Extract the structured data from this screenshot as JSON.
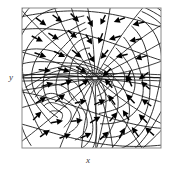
{
  "figure": {
    "type": "vector-field-contour-plot",
    "title": "",
    "xlabel": "x",
    "ylabel": "y",
    "frame": {
      "left": 22,
      "top": 8,
      "right": 161,
      "bottom": 148
    },
    "colors": {
      "background": "#ffffff",
      "frame": "#8a8a8a",
      "contour": "#1a1a1a",
      "arrow": "#000000",
      "label": "#3a3a3a"
    }
  },
  "chart_data": {
    "type": "scatter",
    "title": "",
    "xlabel": "x",
    "ylabel": "y",
    "xlim": [
      0,
      1
    ],
    "ylim": [
      0,
      1
    ],
    "grid": false,
    "legend": null,
    "singular_points": [
      {
        "name": "central-focus",
        "x": 0.525,
        "y": 0.5
      },
      {
        "name": "lower-left-node",
        "x": 0.24,
        "y": 0.22
      }
    ],
    "contour_families": [
      {
        "name": "upper-left-fan",
        "center_x": 0.52,
        "center_y": 0.5,
        "count": 14
      },
      {
        "name": "lower-right-fan",
        "center_x": 0.52,
        "center_y": 0.5,
        "count": 14
      },
      {
        "name": "lower-left-fan",
        "center_x": 0.24,
        "center_y": 0.22,
        "count": 9
      },
      {
        "name": "radial-spokes",
        "center_x": 0.525,
        "center_y": 0.5,
        "count": 22
      }
    ],
    "arrows": [
      {
        "x": 0.1,
        "y": 0.93,
        "dx": 0.075,
        "dy": -0.055
      },
      {
        "x": 0.22,
        "y": 0.95,
        "dx": 0.07,
        "dy": -0.05
      },
      {
        "x": 0.35,
        "y": 0.96,
        "dx": 0.06,
        "dy": -0.06
      },
      {
        "x": 0.47,
        "y": 0.94,
        "dx": 0.04,
        "dy": -0.075
      },
      {
        "x": 0.6,
        "y": 0.95,
        "dx": -0.035,
        "dy": -0.07
      },
      {
        "x": 0.74,
        "y": 0.93,
        "dx": -0.08,
        "dy": -0.03
      },
      {
        "x": 0.88,
        "y": 0.9,
        "dx": -0.085,
        "dy": -0.02
      },
      {
        "x": 0.07,
        "y": 0.8,
        "dx": 0.08,
        "dy": -0.04
      },
      {
        "x": 0.19,
        "y": 0.82,
        "dx": 0.075,
        "dy": -0.045
      },
      {
        "x": 0.33,
        "y": 0.84,
        "dx": 0.065,
        "dy": -0.055
      },
      {
        "x": 0.46,
        "y": 0.81,
        "dx": 0.045,
        "dy": -0.07
      },
      {
        "x": 0.58,
        "y": 0.82,
        "dx": -0.03,
        "dy": -0.075
      },
      {
        "x": 0.71,
        "y": 0.8,
        "dx": -0.085,
        "dy": -0.025
      },
      {
        "x": 0.86,
        "y": 0.78,
        "dx": -0.088,
        "dy": -0.015
      },
      {
        "x": 0.09,
        "y": 0.68,
        "dx": 0.085,
        "dy": -0.03
      },
      {
        "x": 0.23,
        "y": 0.69,
        "dx": 0.08,
        "dy": -0.04
      },
      {
        "x": 0.36,
        "y": 0.7,
        "dx": 0.07,
        "dy": -0.055
      },
      {
        "x": 0.48,
        "y": 0.68,
        "dx": 0.04,
        "dy": -0.07
      },
      {
        "x": 0.62,
        "y": 0.7,
        "dx": -0.055,
        "dy": -0.065
      },
      {
        "x": 0.76,
        "y": 0.67,
        "dx": -0.085,
        "dy": -0.02
      },
      {
        "x": 0.9,
        "y": 0.66,
        "dx": -0.085,
        "dy": -0.025
      },
      {
        "x": 0.12,
        "y": 0.56,
        "dx": 0.088,
        "dy": -0.01
      },
      {
        "x": 0.26,
        "y": 0.57,
        "dx": 0.085,
        "dy": -0.025
      },
      {
        "x": 0.39,
        "y": 0.58,
        "dx": 0.075,
        "dy": -0.045
      },
      {
        "x": 0.64,
        "y": 0.57,
        "dx": -0.06,
        "dy": -0.06
      },
      {
        "x": 0.78,
        "y": 0.55,
        "dx": -0.03,
        "dy": -0.08
      },
      {
        "x": 0.91,
        "y": 0.54,
        "dx": -0.07,
        "dy": -0.05
      },
      {
        "x": 0.14,
        "y": 0.44,
        "dx": 0.085,
        "dy": 0.025
      },
      {
        "x": 0.28,
        "y": 0.45,
        "dx": 0.082,
        "dy": 0.035
      },
      {
        "x": 0.41,
        "y": 0.44,
        "dx": 0.07,
        "dy": 0.05
      },
      {
        "x": 0.65,
        "y": 0.43,
        "dx": -0.055,
        "dy": 0.065
      },
      {
        "x": 0.79,
        "y": 0.44,
        "dx": -0.035,
        "dy": 0.08
      },
      {
        "x": 0.92,
        "y": 0.42,
        "dx": -0.065,
        "dy": 0.055
      },
      {
        "x": 0.1,
        "y": 0.32,
        "dx": 0.075,
        "dy": 0.045
      },
      {
        "x": 0.24,
        "y": 0.33,
        "dx": 0.07,
        "dy": 0.055
      },
      {
        "x": 0.38,
        "y": 0.32,
        "dx": 0.085,
        "dy": 0.02
      },
      {
        "x": 0.52,
        "y": 0.31,
        "dx": 0.08,
        "dy": 0.035
      },
      {
        "x": 0.67,
        "y": 0.31,
        "dx": -0.05,
        "dy": 0.07
      },
      {
        "x": 0.81,
        "y": 0.32,
        "dx": -0.06,
        "dy": 0.065
      },
      {
        "x": 0.93,
        "y": 0.3,
        "dx": -0.07,
        "dy": 0.05
      },
      {
        "x": 0.08,
        "y": 0.2,
        "dx": 0.06,
        "dy": 0.06
      },
      {
        "x": 0.21,
        "y": 0.18,
        "dx": 0.085,
        "dy": 0.015
      },
      {
        "x": 0.35,
        "y": 0.19,
        "dx": 0.088,
        "dy": 0.01
      },
      {
        "x": 0.49,
        "y": 0.18,
        "dx": 0.075,
        "dy": 0.045
      },
      {
        "x": 0.63,
        "y": 0.19,
        "dx": 0.055,
        "dy": 0.065
      },
      {
        "x": 0.77,
        "y": 0.2,
        "dx": -0.045,
        "dy": 0.072
      },
      {
        "x": 0.9,
        "y": 0.18,
        "dx": -0.06,
        "dy": 0.062
      },
      {
        "x": 0.13,
        "y": 0.08,
        "dx": 0.07,
        "dy": 0.05
      },
      {
        "x": 0.27,
        "y": 0.07,
        "dx": 0.082,
        "dy": 0.03
      },
      {
        "x": 0.42,
        "y": 0.07,
        "dx": 0.08,
        "dy": 0.038
      },
      {
        "x": 0.56,
        "y": 0.06,
        "dx": 0.065,
        "dy": 0.058
      },
      {
        "x": 0.7,
        "y": 0.07,
        "dx": 0.04,
        "dy": 0.075
      },
      {
        "x": 0.84,
        "y": 0.08,
        "dx": -0.05,
        "dy": 0.07
      },
      {
        "x": 0.95,
        "y": 0.09,
        "dx": -0.065,
        "dy": 0.058
      }
    ]
  }
}
